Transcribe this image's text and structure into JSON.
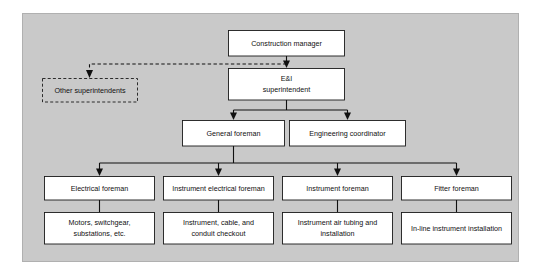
{
  "diagram": {
    "panel_color": "#c9c9c9",
    "box_fill": "#ffffff",
    "line_color": "#101010",
    "levels": [
      {
        "level": 1,
        "nodes": [
          {
            "id": "construction-manager",
            "lines": [
              "Construction manager"
            ],
            "style": "solid"
          }
        ]
      },
      {
        "level": 2,
        "nodes": [
          {
            "id": "other-superintendents",
            "lines": [
              "Other superintendents"
            ],
            "style": "dashed"
          },
          {
            "id": "ei-superintendent",
            "lines": [
              "E&I",
              "superintendent"
            ],
            "style": "solid"
          }
        ]
      },
      {
        "level": 3,
        "nodes": [
          {
            "id": "general-foreman",
            "lines": [
              "General foreman"
            ],
            "style": "solid"
          },
          {
            "id": "engineering-coordinator",
            "lines": [
              "Engineering coordinator"
            ],
            "style": "solid"
          }
        ]
      },
      {
        "level": 4,
        "nodes": [
          {
            "id": "electrical-foreman",
            "lines": [
              "Electrical foreman"
            ],
            "style": "solid"
          },
          {
            "id": "instrument-electrical-foreman",
            "lines": [
              "Instrument electrical foreman"
            ],
            "style": "solid"
          },
          {
            "id": "instrument-foreman",
            "lines": [
              "Instrument foreman"
            ],
            "style": "solid"
          },
          {
            "id": "fitter-foreman",
            "lines": [
              "Fitter foreman"
            ],
            "style": "solid"
          }
        ]
      },
      {
        "level": 5,
        "nodes": [
          {
            "id": "motors-switchgear",
            "lines": [
              "Motors, switchgear,",
              "substations, etc."
            ],
            "style": "solid"
          },
          {
            "id": "instrument-cable-conduit",
            "lines": [
              "Instrument, cable, and",
              "conduit checkout"
            ],
            "style": "solid"
          },
          {
            "id": "instrument-air-tubing",
            "lines": [
              "Instrument air tubing and",
              "installation"
            ],
            "style": "solid"
          },
          {
            "id": "in-line-instrument",
            "lines": [
              "In-line instrument installation"
            ],
            "style": "solid"
          }
        ]
      }
    ],
    "labels": {
      "construction_manager": "Construction manager",
      "other_superintendents": "Other superintendents",
      "ei_superintendent_line1": "E&I",
      "ei_superintendent_line2": "superintendent",
      "general_foreman": "General foreman",
      "engineering_coordinator": "Engineering coordinator",
      "electrical_foreman": "Electrical foreman",
      "instrument_electrical_foreman": "Instrument electrical foreman",
      "instrument_foreman": "Instrument foreman",
      "fitter_foreman": "Fitter foreman",
      "motors_line1": "Motors, switchgear,",
      "motors_line2": "substations, etc.",
      "instrument_cable_line1": "Instrument, cable, and",
      "instrument_cable_line2": "conduit checkout",
      "instrument_air_line1": "Instrument air tubing and",
      "instrument_air_line2": "installation",
      "in_line_instrument": "In-line instrument installation"
    }
  }
}
